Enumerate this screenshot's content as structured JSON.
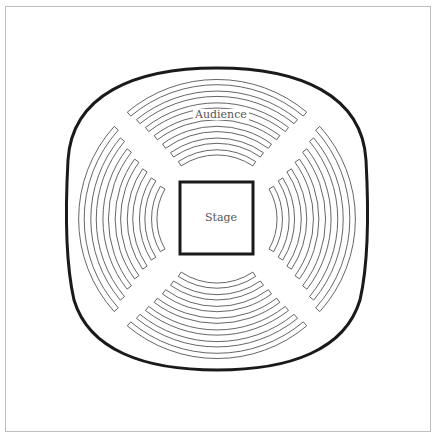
{
  "diagram": {
    "type": "theater-in-the-round floor plan",
    "labels": {
      "audience": "Audience",
      "stage": "Stage"
    },
    "sections": [
      {
        "name": "top",
        "rows": 7
      },
      {
        "name": "right",
        "rows": 7
      },
      {
        "name": "bottom",
        "rows": 7
      },
      {
        "name": "left",
        "rows": 7
      }
    ],
    "colors": {
      "outline": "#1a1a1a",
      "rows": "#555555",
      "frame": "#bdbdbd",
      "background": "#ffffff"
    }
  }
}
